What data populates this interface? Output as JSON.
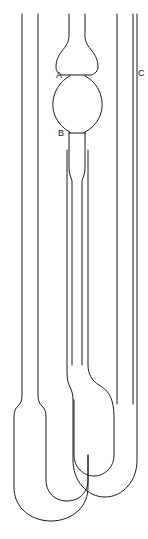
{
  "figure": {
    "name": "ubbelohde-viscometer-diagram",
    "background_color": "#ffffff",
    "stroke_color": "#1a1a1a",
    "width": 148,
    "height": 539
  },
  "labels": [
    {
      "id": "A",
      "text": "A",
      "x": 62,
      "y": 77,
      "describes": "upper-timing-mark-A"
    },
    {
      "id": "B",
      "text": "B",
      "x": 62,
      "y": 135,
      "describes": "lower-timing-mark-B"
    },
    {
      "id": "C",
      "text": "C",
      "x": 135,
      "y": 73,
      "describes": "venting-tube-C"
    }
  ],
  "parts": {
    "left_tube": "filling-tube",
    "center_tube": "capillary-measuring-tube",
    "right_tube": "venting-tube",
    "upper_bulb": "upper-reservoir-bulb",
    "timing_bulb": "timing-bulb",
    "capillary": "capillary",
    "lower_reservoir": "lower-reservoir-bulb",
    "u_bend": "bottom-u-bend"
  }
}
